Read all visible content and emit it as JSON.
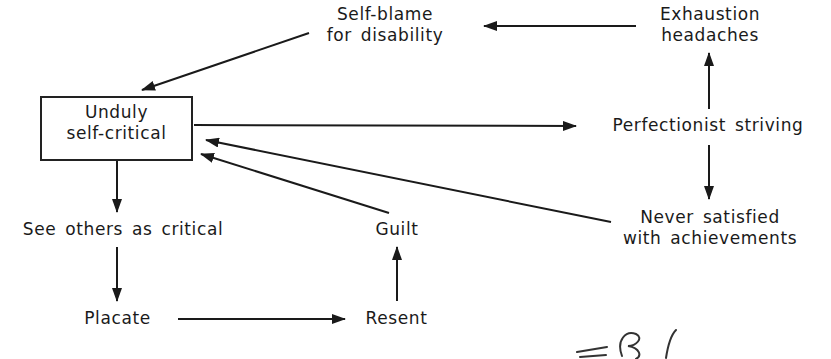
{
  "diagram": {
    "type": "flow-diagram",
    "nodes": {
      "self_blame": {
        "line1": "Self-blame",
        "line2": "for disability"
      },
      "exhaustion": {
        "line1": "Exhaustion",
        "line2": "headaches"
      },
      "unduly": {
        "line1": "Unduly",
        "line2": "self-critical",
        "boxed": true
      },
      "perfectionist": {
        "label": "Perfectionist striving"
      },
      "never_satisfied": {
        "line1": "Never satisfied",
        "line2": "with achievements"
      },
      "see_others": {
        "label": "See others as critical"
      },
      "guilt": {
        "label": "Guilt"
      },
      "placate": {
        "label": "Placate"
      },
      "resent": {
        "label": "Resent"
      }
    },
    "edges": [
      {
        "from": "Exhaustion headaches",
        "to": "Self-blame for disability"
      },
      {
        "from": "Self-blame for disability",
        "to": "Unduly self-critical"
      },
      {
        "from": "Unduly self-critical",
        "to": "Perfectionist striving"
      },
      {
        "from": "Perfectionist striving",
        "to": "Exhaustion headaches"
      },
      {
        "from": "Perfectionist striving",
        "to": "Never satisfied with achievements"
      },
      {
        "from": "Never satisfied with achievements",
        "to": "Unduly self-critical"
      },
      {
        "from": "Guilt",
        "to": "Unduly self-critical"
      },
      {
        "from": "Unduly self-critical",
        "to": "See others as critical"
      },
      {
        "from": "See others as critical",
        "to": "Placate"
      },
      {
        "from": "Placate",
        "to": "Resent"
      },
      {
        "from": "Resent",
        "to": "Guilt"
      }
    ],
    "annotation": "handwritten mark (partially cropped)"
  }
}
